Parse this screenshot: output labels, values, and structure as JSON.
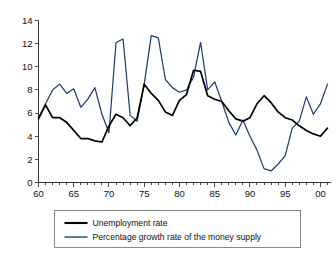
{
  "chart_data": {
    "type": "line",
    "title": "",
    "subtitle": "",
    "xlabel": "",
    "ylabel": "",
    "xlim": [
      60,
      101.5
    ],
    "ylim": [
      0,
      14
    ],
    "yticks": [
      0,
      2,
      4,
      6,
      8,
      10,
      12,
      14
    ],
    "ytick_labels": [
      "0",
      "2",
      "4",
      "6",
      "8",
      "10",
      "12",
      "14"
    ],
    "xticks": [
      60,
      65,
      70,
      75,
      80,
      85,
      90,
      95,
      100
    ],
    "xtick_labels": [
      "60",
      "65",
      "70",
      "75",
      "80",
      "85",
      "90",
      "95",
      "00"
    ],
    "minor_xtick_step": 1,
    "grid": false,
    "legend_position": "below-axes",
    "x": [
      60,
      61,
      62,
      63,
      64,
      65,
      66,
      67,
      68,
      69,
      70,
      71,
      72,
      73,
      74,
      75,
      76,
      77,
      78,
      79,
      80,
      81,
      82,
      83,
      84,
      85,
      86,
      87,
      88,
      89,
      90,
      91,
      92,
      93,
      94,
      95,
      96,
      97,
      98,
      99,
      100,
      101
    ],
    "series": [
      {
        "name": "Unemployment rate",
        "color": "#000000",
        "values": [
          5.5,
          6.7,
          5.6,
          5.6,
          5.2,
          4.5,
          3.8,
          3.8,
          3.6,
          3.5,
          4.9,
          5.9,
          5.6,
          4.9,
          5.6,
          8.5,
          7.7,
          7.1,
          6.1,
          5.8,
          7.1,
          7.6,
          9.7,
          9.6,
          7.5,
          7.2,
          7.0,
          6.2,
          5.5,
          5.3,
          5.6,
          6.8,
          7.5,
          6.9,
          6.1,
          5.6,
          5.4,
          4.9,
          4.5,
          4.2,
          4.0,
          4.7
        ],
        "unit": "percent"
      },
      {
        "name": "Percentage growth rate of the money supply",
        "color": "#1f3e73",
        "values": [
          5.6,
          6.8,
          8.0,
          8.5,
          7.7,
          8.1,
          6.5,
          7.2,
          8.2,
          5.9,
          4.3,
          12.1,
          12.4,
          5.8,
          5.3,
          8.5,
          12.7,
          12.5,
          8.9,
          8.2,
          7.8,
          8.0,
          9.1,
          12.1,
          8.0,
          8.7,
          7.0,
          5.2,
          4.1,
          5.4,
          4.0,
          2.8,
          1.2,
          1.0,
          1.6,
          2.3,
          4.7,
          5.3,
          7.4,
          5.9,
          6.8,
          8.5
        ],
        "unit": "percent"
      }
    ],
    "legend_entries": [
      {
        "label": "Unemployment rate",
        "color": "#000000",
        "swatch": "thick-black-line"
      },
      {
        "label": "Percentage growth rate of the money supply",
        "color": "#1f3e73",
        "swatch": "thin-blue-line"
      }
    ]
  }
}
